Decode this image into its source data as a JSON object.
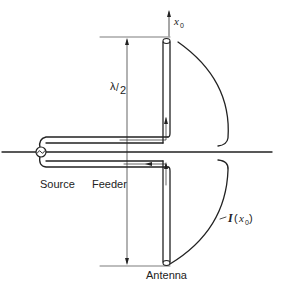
{
  "diagram": {
    "labels": {
      "source": "Source",
      "feeder": "Feeder",
      "antenna": "Antenna",
      "length_lambda": "λ",
      "length_slash": "/",
      "length_den": "2",
      "axis_var": "x",
      "axis_sub": "0",
      "current_I": "I",
      "current_open": "(",
      "current_var": "x",
      "current_sub": "0",
      "current_close": ")"
    },
    "components": [
      "source",
      "feeder",
      "antenna",
      "current-distribution-curve",
      "half-wavelength-dimension",
      "ground-axis"
    ],
    "colors": {
      "line": "#222222",
      "background": "#ffffff"
    }
  }
}
